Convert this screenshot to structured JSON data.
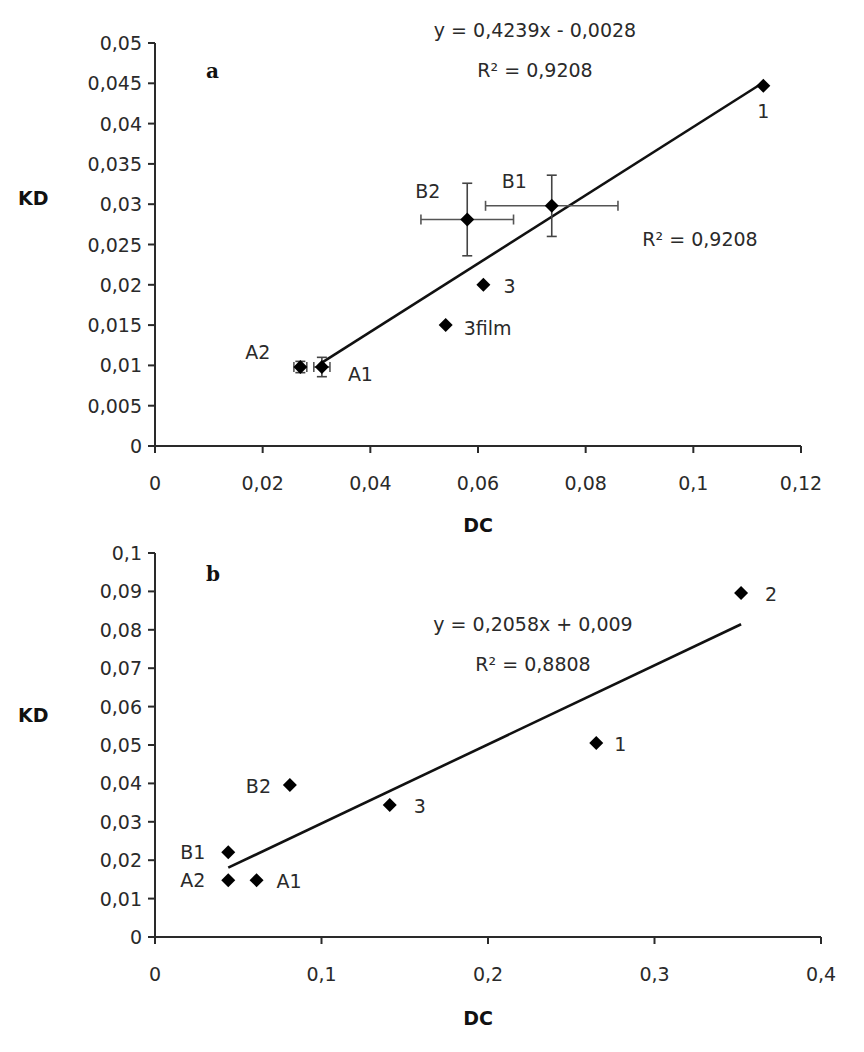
{
  "chart_data": [
    {
      "panel": "a",
      "type": "scatter",
      "title": "",
      "xlabel": "DC",
      "ylabel": "KD",
      "xlim": [
        0,
        0.12
      ],
      "ylim": [
        0,
        0.05
      ],
      "x_ticks": [
        "0",
        "0,02",
        "0,04",
        "0,06",
        "0,08",
        "0,1",
        "0,12"
      ],
      "y_ticks": [
        "0",
        "0,005",
        "0,01",
        "0,015",
        "0,02",
        "0,025",
        "0,03",
        "0,035",
        "0,04",
        "0,045",
        "0,05"
      ],
      "grid": false,
      "legend": null,
      "points": [
        {
          "label": "1",
          "x": 0.113,
          "y": 0.0447
        },
        {
          "label": "B1",
          "x": 0.0737,
          "y": 0.0298,
          "x_err": 0.0123,
          "y_err": 0.0038
        },
        {
          "label": "B2",
          "x": 0.058,
          "y": 0.0281,
          "x_err": 0.0086,
          "y_err": 0.0045
        },
        {
          "label": "3",
          "x": 0.061,
          "y": 0.02
        },
        {
          "label": "3film",
          "x": 0.054,
          "y": 0.015
        },
        {
          "label": "A1",
          "x": 0.031,
          "y": 0.0098,
          "x_err": 0.0015,
          "y_err": 0.0012
        },
        {
          "label": "A2",
          "x": 0.027,
          "y": 0.0098,
          "x_err": 0.0012,
          "y_err": 0.0007
        }
      ],
      "trendline": {
        "slope": 0.4239,
        "intercept": -0.0028,
        "x_range": [
          0.031,
          0.113
        ]
      },
      "annotations": {
        "equation": "y = 0,4239x - 0,0028",
        "r2_top": "R² = 0,9208",
        "r2_side": "R² = 0,9208"
      }
    },
    {
      "panel": "b",
      "type": "scatter",
      "title": "",
      "xlabel": "DC",
      "ylabel": "KD",
      "xlim": [
        0,
        0.4
      ],
      "ylim": [
        0,
        0.1
      ],
      "x_ticks": [
        "0",
        "0,1",
        "0,2",
        "0,3",
        "0,4"
      ],
      "y_ticks": [
        "0",
        "0,01",
        "0,02",
        "0,03",
        "0,04",
        "0,05",
        "0,06",
        "0,07",
        "0,08",
        "0,09",
        "0,1"
      ],
      "grid": false,
      "legend": null,
      "points": [
        {
          "label": "2",
          "x": 0.352,
          "y": 0.0896
        },
        {
          "label": "1",
          "x": 0.265,
          "y": 0.0505
        },
        {
          "label": "3",
          "x": 0.141,
          "y": 0.0344
        },
        {
          "label": "B2",
          "x": 0.081,
          "y": 0.0396
        },
        {
          "label": "B1",
          "x": 0.044,
          "y": 0.0221
        },
        {
          "label": "A2",
          "x": 0.044,
          "y": 0.0148
        },
        {
          "label": "A1",
          "x": 0.061,
          "y": 0.0148
        }
      ],
      "trendline": {
        "slope": 0.2058,
        "intercept": 0.009,
        "x_range": [
          0.044,
          0.352
        ]
      },
      "annotations": {
        "equation": "y = 0,2058x + 0,009",
        "r2_top": "R² = 0,8808"
      }
    }
  ],
  "figure": {
    "panel_a_letter": "a",
    "panel_b_letter": "b",
    "axis_color": "#2a2a2a",
    "marker_color": "#000000"
  }
}
